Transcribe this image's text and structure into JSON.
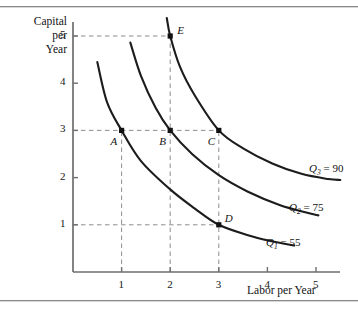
{
  "figure": {
    "y_axis_title_lines": [
      "Capital",
      "per",
      "Year"
    ],
    "x_axis_title": "Labor per Year"
  },
  "chart_data": {
    "type": "line",
    "title": "",
    "xlabel": "Labor per Year",
    "ylabel": "Capital per Year",
    "xlim": [
      0,
      5.85
    ],
    "ylim": [
      0,
      5.45
    ],
    "grid": false,
    "legend_position": "right-inline",
    "xticks": [
      1,
      2,
      3,
      4,
      5
    ],
    "xtick_labels": [
      "1",
      "2",
      "3",
      "4",
      "5"
    ],
    "yticks": [
      1,
      2,
      3,
      4,
      5
    ],
    "ytick_labels": [
      "1",
      "2",
      "3",
      "4",
      "5"
    ],
    "series": [
      {
        "name": "Q1",
        "label": "Q",
        "label_sub": "1",
        "label_eq": "= 55",
        "value": 55,
        "points": [
          [
            0.5,
            4.45
          ],
          [
            0.7,
            3.6
          ],
          [
            1.0,
            3.0
          ],
          [
            1.4,
            2.35
          ],
          [
            2.0,
            1.75
          ],
          [
            2.5,
            1.35
          ],
          [
            3.0,
            1.0
          ],
          [
            3.6,
            0.78
          ],
          [
            4.1,
            0.65
          ],
          [
            4.55,
            0.56
          ]
        ]
      },
      {
        "name": "Q2",
        "label": "Q",
        "label_sub": "2",
        "label_eq": "= 75",
        "value": 75,
        "points": [
          [
            1.18,
            4.86
          ],
          [
            1.4,
            4.15
          ],
          [
            1.7,
            3.48
          ],
          [
            2.0,
            3.0
          ],
          [
            2.45,
            2.5
          ],
          [
            3.0,
            2.05
          ],
          [
            3.6,
            1.7
          ],
          [
            4.25,
            1.42
          ],
          [
            4.8,
            1.26
          ],
          [
            5.05,
            1.2
          ]
        ]
      },
      {
        "name": "Q3",
        "label": "Q",
        "label_sub": "3",
        "label_eq": "= 90",
        "value": 90,
        "points": [
          [
            1.93,
            5.38
          ],
          [
            2.0,
            5.0
          ],
          [
            2.2,
            4.35
          ],
          [
            2.5,
            3.75
          ],
          [
            3.0,
            3.0
          ],
          [
            3.5,
            2.62
          ],
          [
            4.1,
            2.3
          ],
          [
            4.7,
            2.08
          ],
          [
            5.25,
            1.97
          ],
          [
            5.5,
            1.95
          ]
        ]
      }
    ],
    "annotated_points": [
      {
        "name": "A",
        "x": 1,
        "y": 3,
        "curve": "Q1",
        "label_dx": -11,
        "label_dy": 6
      },
      {
        "name": "B",
        "x": 2,
        "y": 3,
        "curve": "Q2",
        "label_dx": -11,
        "label_dy": 6
      },
      {
        "name": "C",
        "x": 3,
        "y": 3,
        "curve": "Q3",
        "label_dx": -11,
        "label_dy": 6
      },
      {
        "name": "D",
        "x": 3,
        "y": 1,
        "curve": "Q1",
        "label_dx": 6,
        "label_dy": -12
      },
      {
        "name": "E",
        "x": 2,
        "y": 5,
        "curve": "Q3",
        "label_dx": 7,
        "label_dy": -11
      }
    ],
    "guide_lines": [
      {
        "orientation": "horizontal",
        "value": 5,
        "from": 0,
        "to": 2
      },
      {
        "orientation": "horizontal",
        "value": 3,
        "from": 0,
        "to": 3
      },
      {
        "orientation": "horizontal",
        "value": 1,
        "from": 0,
        "to": 3
      },
      {
        "orientation": "vertical",
        "value": 1,
        "from": 0,
        "to": 3
      },
      {
        "orientation": "vertical",
        "value": 2,
        "from": 0,
        "to": 5
      },
      {
        "orientation": "vertical",
        "value": 3,
        "from": 0,
        "to": 3
      }
    ],
    "colors": {
      "curve": "#1c1c1c",
      "axis": "#6e6e6e",
      "guide": "#8d8d8d",
      "marker": "#111111",
      "background": "#ffffff"
    }
  }
}
